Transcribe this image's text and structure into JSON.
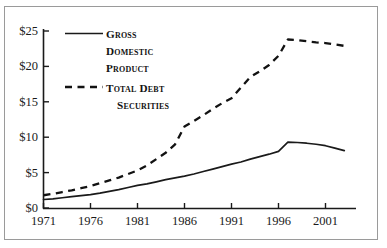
{
  "chart_data": {
    "type": "line",
    "title": "",
    "subtitle": "",
    "xlabel": "",
    "ylabel": "",
    "xlim": [
      1971,
      2003
    ],
    "ylim": [
      0,
      25
    ],
    "grid": false,
    "legend_position": "inside-upper-left",
    "y_unit": "trillions of dollars",
    "x_ticks": [
      1971,
      1976,
      1981,
      1986,
      1991,
      1996,
      2001
    ],
    "x_tick_labels": [
      "1971",
      "1976",
      "1981",
      "1986",
      "1991",
      "1996",
      "2001"
    ],
    "y_ticks": [
      0,
      5,
      10,
      15,
      20,
      25
    ],
    "y_tick_labels": [
      "$0",
      "$5",
      "$10",
      "$15",
      "$20",
      "$25"
    ],
    "series": [
      {
        "name": "Gross Domestic Product",
        "legend_label_lines": [
          "Gross",
          "Domestic",
          "Product"
        ],
        "style": "solid",
        "color": "#1a1a1a",
        "x": [
          1971,
          1972,
          1973,
          1974,
          1975,
          1976,
          1977,
          1978,
          1979,
          1980,
          1981,
          1982,
          1983,
          1984,
          1985,
          1986,
          1987,
          1988,
          1989,
          1990,
          1991,
          1992,
          1993,
          1994,
          1995,
          1996,
          1997,
          1998,
          1999,
          2000,
          2001,
          2002,
          2003
        ],
        "values": [
          1.2,
          1.3,
          1.45,
          1.6,
          1.75,
          1.9,
          2.1,
          2.35,
          2.6,
          2.9,
          3.2,
          3.4,
          3.7,
          4.0,
          4.25,
          4.5,
          4.8,
          5.15,
          5.5,
          5.85,
          6.2,
          6.5,
          6.9,
          7.25,
          7.6,
          8.0,
          9.3,
          9.25,
          9.15,
          9.0,
          8.8,
          8.45,
          8.1
        ]
      },
      {
        "name": "Total Debt Securities",
        "legend_label_lines": [
          "Total Debt",
          "Securities"
        ],
        "style": "dashed",
        "color": "#121212",
        "x": [
          1971,
          1972,
          1973,
          1974,
          1975,
          1976,
          1977,
          1978,
          1979,
          1980,
          1981,
          1982,
          1983,
          1984,
          1985,
          1986,
          1987,
          1988,
          1989,
          1990,
          1991,
          1992,
          1993,
          1994,
          1995,
          1996,
          1997,
          1998,
          1999,
          2000,
          2001,
          2002,
          2003
        ],
        "values": [
          1.8,
          2.0,
          2.25,
          2.5,
          2.8,
          3.1,
          3.5,
          3.9,
          4.3,
          4.8,
          5.3,
          6.0,
          6.9,
          7.8,
          9.0,
          11.5,
          12.3,
          13.1,
          14.0,
          14.8,
          15.5,
          17.0,
          18.5,
          19.3,
          20.2,
          21.5,
          23.8,
          23.7,
          23.55,
          23.4,
          23.3,
          23.1,
          22.9
        ]
      }
    ]
  },
  "legend": {
    "series_1_lines": [
      "Gross",
      "Domestic",
      "Product"
    ],
    "series_2_lines": [
      "Total Debt",
      "Securities"
    ]
  },
  "axes": {
    "y_tick_labels": [
      "$25",
      "$20",
      "$15",
      "$10",
      "$5",
      "$0"
    ],
    "x_tick_labels": [
      "1971",
      "1976",
      "1981",
      "1986",
      "1991",
      "1996",
      "2001"
    ]
  },
  "colors": {
    "line": "#1a1a1a",
    "axis": "#1a1a1a",
    "frame": "#9a9a9a",
    "background": "#ffffff"
  }
}
